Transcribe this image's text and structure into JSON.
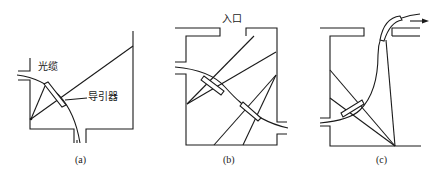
{
  "panels": [
    {
      "id": "a",
      "caption": "(a)",
      "labels": {
        "cable": "光缆",
        "guide": "导引器"
      }
    },
    {
      "id": "b",
      "caption": "(b)",
      "labels": {
        "inlet": "入口"
      }
    },
    {
      "id": "c",
      "caption": "(c)",
      "labels": {}
    }
  ],
  "colors": {
    "line": "#1a1a1a",
    "background": "#ffffff"
  }
}
